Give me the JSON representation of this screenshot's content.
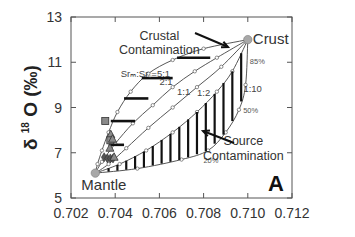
{
  "chart_data": {
    "type": "line",
    "title": "",
    "panel_label": "A",
    "xlabel": "",
    "ylabel": "δ 18O (‰)",
    "ylabel_parts": {
      "delta": "δ",
      "sup": "18",
      "rest": "O (‰)"
    },
    "xlim": [
      0.702,
      0.712
    ],
    "ylim": [
      5,
      13
    ],
    "x_ticks": [
      0.702,
      0.704,
      0.706,
      0.708,
      0.71,
      0.712
    ],
    "x_tick_labels": [
      "0.702",
      "0.704",
      "0.706",
      "0.708",
      "0.710",
      "0.712"
    ],
    "y_ticks": [
      5,
      7,
      9,
      11,
      13
    ],
    "y_tick_labels": [
      "5",
      "7",
      "9",
      "11",
      "13"
    ],
    "grid": false,
    "legend": null,
    "endmembers": [
      {
        "name": "Mantle",
        "x": 0.7031,
        "y": 6.1
      },
      {
        "name": "Crust",
        "x": 0.71,
        "y": 12.0
      }
    ],
    "mixing_curves": [
      {
        "name": "Sr_M:Sr_C=5:1",
        "points": [
          [
            0.7031,
            6.1
          ],
          [
            0.7032,
            6.5
          ],
          [
            0.7034,
            7.1
          ],
          [
            0.7037,
            7.9
          ],
          [
            0.7041,
            8.8
          ],
          [
            0.7047,
            9.7
          ],
          [
            0.7055,
            10.5
          ],
          [
            0.7066,
            11.1
          ],
          [
            0.708,
            11.6
          ],
          [
            0.71,
            12.0
          ]
        ]
      },
      {
        "name": "2:1",
        "points": [
          [
            0.7031,
            6.1
          ],
          [
            0.7034,
            6.6
          ],
          [
            0.704,
            7.4
          ],
          [
            0.7048,
            8.3
          ],
          [
            0.7057,
            9.1
          ],
          [
            0.7066,
            9.9
          ],
          [
            0.7076,
            10.6
          ],
          [
            0.7086,
            11.2
          ],
          [
            0.71,
            12.0
          ]
        ]
      },
      {
        "name": "1:1",
        "points": [
          [
            0.7031,
            6.1
          ],
          [
            0.7037,
            6.5
          ],
          [
            0.7045,
            7.2
          ],
          [
            0.7055,
            8.1
          ],
          [
            0.7066,
            9.0
          ],
          [
            0.7077,
            9.9
          ],
          [
            0.7088,
            10.8
          ],
          [
            0.71,
            12.0
          ]
        ]
      },
      {
        "name": "1:2",
        "points": [
          [
            0.7031,
            6.1
          ],
          [
            0.7042,
            6.5
          ],
          [
            0.7054,
            7.1
          ],
          [
            0.7066,
            7.9
          ],
          [
            0.7077,
            8.8
          ],
          [
            0.7086,
            9.7
          ],
          [
            0.7093,
            10.6
          ],
          [
            0.71,
            12.0
          ]
        ]
      },
      {
        "name": "1:10",
        "points": [
          [
            0.7031,
            6.1
          ],
          [
            0.705,
            6.3
          ],
          [
            0.707,
            6.7
          ],
          [
            0.7082,
            7.1
          ],
          [
            0.709,
            7.9
          ],
          [
            0.7096,
            8.9
          ],
          [
            0.7099,
            10.0
          ],
          [
            0.71,
            12.0
          ]
        ]
      }
    ],
    "crustal_contamination_ticks": [
      {
        "x1": 0.7037,
        "x2": 0.7044,
        "y": 7.35
      },
      {
        "x1": 0.7038,
        "x2": 0.7049,
        "y": 8.4
      },
      {
        "x1": 0.7044,
        "x2": 0.7055,
        "y": 9.4
      },
      {
        "x1": 0.7052,
        "x2": 0.7066,
        "y": 10.3
      },
      {
        "x1": 0.7068,
        "x2": 0.7083,
        "y": 11.2
      }
    ],
    "source_contamination_hatch_x": [
      0.7037,
      0.7041,
      0.7045,
      0.7049,
      0.7053,
      0.7057,
      0.7061,
      0.7065,
      0.7069,
      0.7073,
      0.7077,
      0.7081,
      0.7085,
      0.7089,
      0.7093,
      0.7097
    ],
    "percent_labels": [
      {
        "text": "20%",
        "x": 0.7079,
        "y": 6.7
      },
      {
        "text": "50%",
        "x": 0.7097,
        "y": 8.9
      },
      {
        "text": "85%",
        "x": 0.71,
        "y": 11.05
      }
    ],
    "ratio_labels": [
      {
        "text": "Srₘ:Sr꜀=5:1",
        "x": 0.70425,
        "y": 10.35
      },
      {
        "text": "2:1",
        "x": 0.706,
        "y": 10.0
      },
      {
        "text": "1:1",
        "x": 0.7068,
        "y": 9.55
      },
      {
        "text": "1:2",
        "x": 0.7077,
        "y": 9.5
      },
      {
        "text": "1:10",
        "x": 0.7098,
        "y": 9.7
      }
    ],
    "annotations": [
      {
        "text": "Crustal",
        "x": 0.706,
        "y": 12.0
      },
      {
        "text": "Contamination",
        "x": 0.706,
        "y": 11.35
      },
      {
        "text": "Source",
        "x": 0.7098,
        "y": 7.35
      },
      {
        "text": "Contamination",
        "x": 0.7098,
        "y": 6.7
      }
    ],
    "samples": [
      {
        "marker": "square",
        "x": 0.70355,
        "y": 8.4
      },
      {
        "marker": "triangle",
        "x": 0.7038,
        "y": 7.8
      },
      {
        "marker": "square",
        "x": 0.70378,
        "y": 7.55
      },
      {
        "marker": "triangle",
        "x": 0.70388,
        "y": 7.6
      },
      {
        "marker": "triangle",
        "x": 0.70376,
        "y": 7.2
      },
      {
        "marker": "diamond",
        "x": 0.7035,
        "y": 6.8
      },
      {
        "marker": "diamond",
        "x": 0.70365,
        "y": 6.75
      },
      {
        "marker": "diamond",
        "x": 0.70378,
        "y": 6.75
      },
      {
        "marker": "diamond",
        "x": 0.7039,
        "y": 6.75
      },
      {
        "marker": "triangle",
        "x": 0.70395,
        "y": 6.8
      }
    ],
    "colors": {
      "axis": "#555555",
      "curve": "#444444",
      "tick": "#111111",
      "endmember": "#a8a8a8",
      "sample": "#8a8a8a"
    }
  }
}
